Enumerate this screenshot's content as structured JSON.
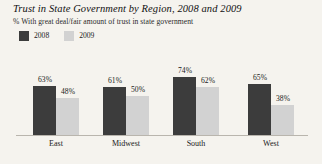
{
  "chart_data": {
    "type": "bar",
    "title": "Trust in State Government by Region, 2008 and 2009",
    "subtitle": "% With great deal/fair amount of trust in state government",
    "categories": [
      "East",
      "Midwest",
      "South",
      "West"
    ],
    "series": [
      {
        "name": "2008",
        "color": "#3c3c3c",
        "values": [
          63,
          61,
          74,
          65
        ],
        "labels": [
          "63%",
          "61%",
          "74%",
          "65%"
        ]
      },
      {
        "name": "2009",
        "color": "#d2d2d2",
        "values": [
          48,
          50,
          62,
          38
        ],
        "labels": [
          "48%",
          "50%",
          "62%",
          "38%"
        ]
      }
    ],
    "xlabel": "",
    "ylabel": "",
    "ylim": [
      0,
      100
    ],
    "grid": false,
    "legend_position": "top-left",
    "value_labels_shown": true,
    "background_color": "#f5f3ee",
    "axis_color": "#b9b5ad"
  }
}
